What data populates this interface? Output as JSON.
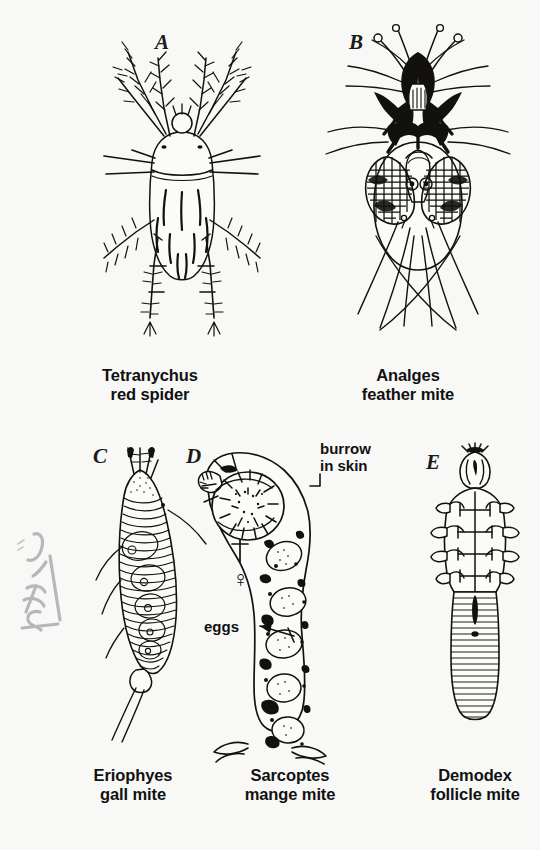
{
  "plate": {
    "background_color": "#f8f8f7",
    "ink_color": "#13110f",
    "kind": "scientific-illustration-plate",
    "subject": "mites"
  },
  "panels": [
    {
      "letter": "A",
      "caption": "Tetranychus\nred spider",
      "genus": "Tetranychus",
      "common_name": "red spider",
      "annotations": []
    },
    {
      "letter": "B",
      "caption": "Analges\nfeather mite",
      "genus": "Analges",
      "common_name": "feather mite",
      "annotations": []
    },
    {
      "letter": "C",
      "caption": "Eriophyes\ngall mite",
      "genus": "Eriophyes",
      "common_name": "gall mite",
      "annotations": []
    },
    {
      "letter": "D",
      "caption": "Sarcoptes\nmange mite",
      "genus": "Sarcoptes",
      "common_name": "mange mite",
      "annotations": [
        {
          "name": "burrow-label",
          "text": "burrow\nin skin"
        },
        {
          "name": "female-symbol",
          "text": "♀"
        },
        {
          "name": "eggs-label",
          "text": "eggs"
        }
      ]
    },
    {
      "letter": "E",
      "caption": "Demodex\nfollicle mite",
      "genus": "Demodex",
      "common_name": "follicle mite",
      "annotations": []
    }
  ],
  "margin_note": {
    "name": "handwritten-margin-note",
    "text": "SK 16",
    "legible": false,
    "color": "#8a8a8a"
  }
}
